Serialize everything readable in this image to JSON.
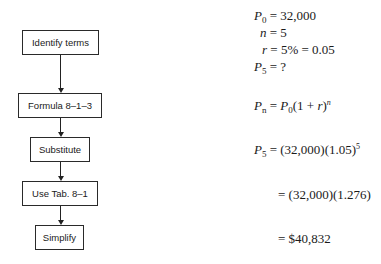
{
  "flowchart": {
    "steps": [
      {
        "label": "Identify terms"
      },
      {
        "label": "Formula 8–1–3"
      },
      {
        "label": "Substitute"
      },
      {
        "label": "Use Tab. 8–1"
      },
      {
        "label": "Simplify"
      }
    ]
  },
  "work": {
    "given": {
      "p0_var": "P",
      "p0_sub": "0",
      "p0_val": "= 32,000",
      "n_var": "n",
      "n_val": "= 5",
      "r_var": "r",
      "r_val": "= 5% = 0.05",
      "p5_var": "P",
      "p5_sub": "5",
      "p5_val": "= ?"
    },
    "formula": {
      "lhs_var": "P",
      "lhs_sub": "n",
      "eq": " = ",
      "rhs_var": "P",
      "rhs_sub": "0",
      "rhs_open": "(1 + ",
      "rhs_r": "r",
      "rhs_close": ")",
      "rhs_exp": "n"
    },
    "substitute": {
      "lhs_var": "P",
      "lhs_sub": "5",
      "rhs": " = (32,000)(1.05)",
      "rhs_exp": "5"
    },
    "table": {
      "text": "= (32,000)(1.276)"
    },
    "simplify": {
      "text": "= $40,832"
    }
  }
}
